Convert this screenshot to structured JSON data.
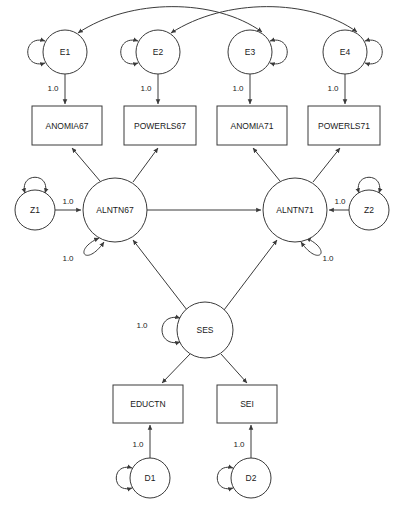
{
  "diagram": {
    "kind": "sem-path-diagram",
    "stroke_color": "#3a3a3a",
    "fill_color": "#ffffff",
    "text_color": "#1a1a1a",
    "width": 412,
    "height": 517
  },
  "nodes": {
    "errors": [
      {
        "id": "E1",
        "label": "E1",
        "cx": 65,
        "cy": 52,
        "r": 22,
        "loop_side": "left"
      },
      {
        "id": "E2",
        "label": "E2",
        "cx": 158,
        "cy": 52,
        "r": 22,
        "loop_side": "left"
      },
      {
        "id": "E3",
        "label": "E3",
        "cx": 250,
        "cy": 52,
        "r": 22,
        "loop_side": "right"
      },
      {
        "id": "E4",
        "label": "E4",
        "cx": 345,
        "cy": 52,
        "r": 22,
        "loop_side": "right"
      }
    ],
    "indicators": [
      {
        "id": "ANOMIA67",
        "label": "ANOMIA67",
        "x": 32,
        "y": 106,
        "w": 70,
        "h": 39
      },
      {
        "id": "POWERLS67",
        "label": "POWERLS67",
        "x": 124,
        "y": 106,
        "w": 72,
        "h": 39
      },
      {
        "id": "ANOMIA71",
        "label": "ANOMIA71",
        "x": 217,
        "y": 106,
        "w": 70,
        "h": 39
      },
      {
        "id": "POWERLS71",
        "label": "POWERLS71",
        "x": 308,
        "y": 106,
        "w": 72,
        "h": 39
      }
    ],
    "latents": [
      {
        "id": "ALNTN67",
        "label": "ALNTN67",
        "cx": 115,
        "cy": 210,
        "r": 32
      },
      {
        "id": "ALNTN71",
        "label": "ALNTN71",
        "cx": 295,
        "cy": 210,
        "r": 32
      },
      {
        "id": "SES",
        "label": "SES",
        "cx": 205,
        "cy": 330,
        "r": 28
      }
    ],
    "disturbances": [
      {
        "id": "Z1",
        "label": "Z1",
        "cx": 35,
        "cy": 210,
        "r": 20,
        "loop_side": "top"
      },
      {
        "id": "Z2",
        "label": "Z2",
        "cx": 369,
        "cy": 210,
        "r": 20,
        "loop_side": "top"
      },
      {
        "id": "D1",
        "label": "D1",
        "cx": 150,
        "cy": 478,
        "r": 20,
        "loop_side": "left"
      },
      {
        "id": "D2",
        "label": "D2",
        "cx": 251,
        "cy": 478,
        "r": 20,
        "loop_side": "left"
      }
    ],
    "ses_indicators": [
      {
        "id": "EDUCTN",
        "label": "EDUCTN",
        "x": 113,
        "y": 385,
        "w": 70,
        "h": 38
      },
      {
        "id": "SEI",
        "label": "SEI",
        "x": 217,
        "y": 385,
        "w": 60,
        "h": 38
      }
    ]
  },
  "coefficients": {
    "e1_to_anomia67": {
      "value": "1.0",
      "x": 53,
      "y": 88
    },
    "e2_to_powerls67": {
      "value": "1.0",
      "x": 146,
      "y": 88
    },
    "e3_to_anomia71": {
      "value": "1.0",
      "x": 238,
      "y": 88
    },
    "e4_to_powerls71": {
      "value": "1.0",
      "x": 333,
      "y": 88
    },
    "z1_to_alntn67": {
      "value": "1.0",
      "x": 68,
      "y": 201
    },
    "z2_to_alntn71": {
      "value": "1.0",
      "x": 340,
      "y": 201
    },
    "alntn67_variance": {
      "value": "1.0",
      "x": 68,
      "y": 258
    },
    "alntn71_variance": {
      "value": "1.0",
      "x": 328,
      "y": 258
    },
    "ses_variance": {
      "value": "1.0",
      "x": 142,
      "y": 325
    },
    "d1_to_eductn": {
      "value": "1.0",
      "x": 138,
      "y": 444
    },
    "d2_to_sei": {
      "value": "1.0",
      "x": 239,
      "y": 444
    }
  },
  "correlations": [
    {
      "from": "E1",
      "to": "E3",
      "type": "double-headed-curved-arc"
    },
    {
      "from": "E2",
      "to": "E4",
      "type": "double-headed-curved-arc"
    }
  ],
  "paths": [
    {
      "from": "E1",
      "to": "ANOMIA67",
      "label": "1.0"
    },
    {
      "from": "E2",
      "to": "POWERLS67",
      "label": "1.0"
    },
    {
      "from": "E3",
      "to": "ANOMIA71",
      "label": "1.0"
    },
    {
      "from": "E4",
      "to": "POWERLS71",
      "label": "1.0"
    },
    {
      "from": "ALNTN67",
      "to": "ANOMIA67",
      "label": ""
    },
    {
      "from": "ALNTN67",
      "to": "POWERLS67",
      "label": ""
    },
    {
      "from": "ALNTN71",
      "to": "ANOMIA71",
      "label": ""
    },
    {
      "from": "ALNTN71",
      "to": "POWERLS71",
      "label": ""
    },
    {
      "from": "Z1",
      "to": "ALNTN67",
      "label": "1.0"
    },
    {
      "from": "Z2",
      "to": "ALNTN71",
      "label": "1.0"
    },
    {
      "from": "ALNTN67",
      "to": "ALNTN71",
      "label": ""
    },
    {
      "from": "SES",
      "to": "ALNTN67",
      "label": ""
    },
    {
      "from": "SES",
      "to": "ALNTN71",
      "label": ""
    },
    {
      "from": "SES",
      "to": "EDUCTN",
      "label": ""
    },
    {
      "from": "SES",
      "to": "SEI",
      "label": ""
    },
    {
      "from": "D1",
      "to": "EDUCTN",
      "label": "1.0"
    },
    {
      "from": "D2",
      "to": "SEI",
      "label": "1.0"
    }
  ]
}
